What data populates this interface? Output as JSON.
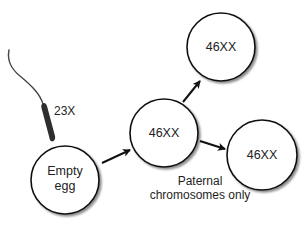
{
  "diagram": {
    "sperm": {
      "label": "23X"
    },
    "nodes": [
      {
        "id": "empty-egg",
        "label_line1": "Empty",
        "label_line2": "egg",
        "cx": 65,
        "cy": 180,
        "r": 34
      },
      {
        "id": "zygote",
        "label": "46XX",
        "cx": 164,
        "cy": 133,
        "r": 34
      },
      {
        "id": "top-cell",
        "label": "46XX",
        "cx": 221,
        "cy": 47,
        "r": 34
      },
      {
        "id": "right-cell",
        "label": "46XX",
        "cx": 262,
        "cy": 155,
        "r": 35
      }
    ],
    "edges": [
      {
        "from": "empty-egg",
        "to": "zygote"
      },
      {
        "from": "zygote",
        "to": "top-cell"
      },
      {
        "from": "zygote",
        "to": "right-cell"
      }
    ],
    "annotation": {
      "line1": "Paternal",
      "line2": "chromosomes only"
    }
  }
}
